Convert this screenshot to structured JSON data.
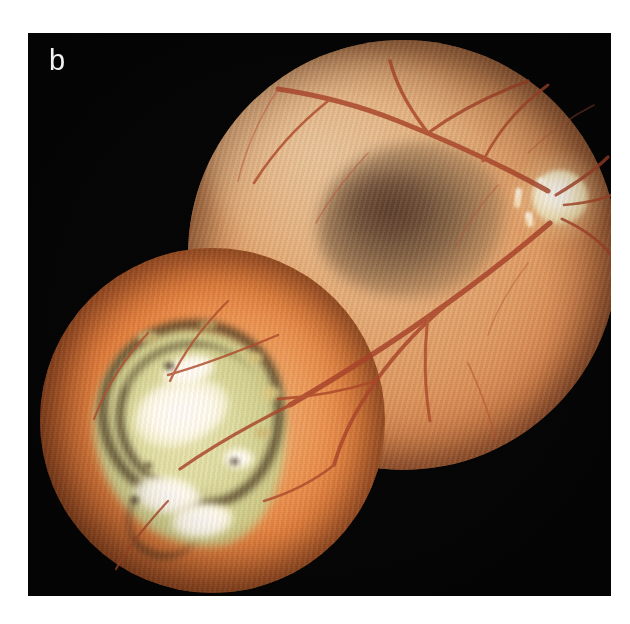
{
  "figure": {
    "panel_label": "b",
    "caption_visible": false,
    "modality": "color fundus photograph",
    "composition": "two-field montage of overlapping circular fundus camera images",
    "background_color": "#050505",
    "page_color": "#ffffff"
  },
  "plate": {
    "left": 28,
    "top": 33,
    "width": 583,
    "height": 563
  },
  "fields": [
    {
      "id": "posterior-pole-field",
      "name": "Upper-right fundus field",
      "shape": "circle",
      "center_x": 375,
      "center_y": 222,
      "radius": 215,
      "base_color": "#dd9a63",
      "rim_color": "#7d3e26",
      "features": [
        {
          "name": "optic-disc",
          "label": "Optic disc",
          "color": "#fdf8e6",
          "center_x": 532,
          "center_y": 190,
          "width": 56,
          "height": 54
        },
        {
          "name": "macular-lesion",
          "label": "Dark grey-brown macular / subretinal lesion",
          "color": "#563e2c",
          "center_x": 385,
          "center_y": 185,
          "width": 190,
          "height": 155
        },
        {
          "name": "superior-sheen",
          "label": "Pale superior-nasal reflex",
          "color": "#e7cca8"
        }
      ]
    },
    {
      "id": "peripheral-lesion-field",
      "name": "Lower-left fundus field",
      "shape": "circle",
      "center_x": 212,
      "center_y": 420,
      "radius": 172,
      "base_color": "#e5823f",
      "rim_color": "#6d3318",
      "features": [
        {
          "name": "chorioretinal-scar",
          "label": "Pale yellow-green chorioretinal scar",
          "color": "#dfe0a6",
          "center_x": 185,
          "center_y": 420,
          "width": 193,
          "height": 221
        },
        {
          "name": "pigment-ring",
          "label": "Hyperpigmented border of scar",
          "color": "#3e2e1a"
        },
        {
          "name": "atrophic-patches",
          "label": "Bright white atrophic / sclera-baring patches",
          "color": "#ffffff",
          "count": 5
        }
      ]
    }
  ],
  "vessels": {
    "name": "Retinal vessel arcades",
    "color_artery": "#b8562f",
    "color_vein": "#9c3b22",
    "origin": "optic disc",
    "description": "Branching superior and inferior temporal arcades radiating from the optic disc across both fields"
  },
  "colors": {
    "plate_black": "#050505",
    "fundus_orange": "#e5823f",
    "fundus_tan": "#e3ab77",
    "vessel_red": "#a8442a",
    "scar_pale": "#dfe0a6",
    "atrophy_white": "#ffffff",
    "pigment_brown": "#3e2e1a",
    "disc_white": "#fdf8e6",
    "label_white": "#f2f2f2"
  }
}
